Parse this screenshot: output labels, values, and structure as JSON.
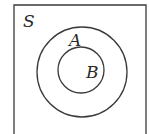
{
  "diagram": {
    "type": "venn",
    "universe": {
      "label": "S"
    },
    "sets": [
      {
        "label": "A"
      },
      {
        "label": "B"
      }
    ],
    "colors": {
      "stroke": "#3a3a3a",
      "background": "#ffffff",
      "text": "#2a2a2a"
    }
  }
}
